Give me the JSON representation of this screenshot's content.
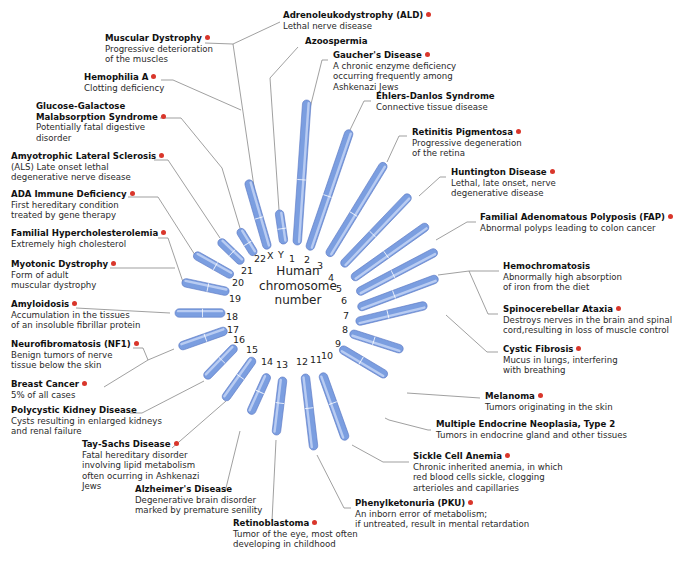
{
  "center_label": [
    "Human",
    "chromosome",
    "number"
  ],
  "colors": {
    "chromosome": "#7b9ee0",
    "chromosome_highlight": "#b9ccf2",
    "leader_line": "#777777",
    "marker_dot": "#d9362b"
  },
  "chromosomes": [
    {
      "id": "1",
      "x1": 307,
      "y1": 100,
      "x2": 297,
      "y2": 245,
      "lx": 293,
      "ly": 259
    },
    {
      "id": "2",
      "x1": 350,
      "y1": 130,
      "x2": 309,
      "y2": 250,
      "lx": 308,
      "ly": 260
    },
    {
      "id": "3",
      "x1": 385,
      "y1": 163,
      "x2": 328,
      "y2": 256,
      "lx": 321,
      "ly": 266
    },
    {
      "id": "4",
      "x1": 410,
      "y1": 195,
      "x2": 342,
      "y2": 266,
      "lx": 332,
      "ly": 278
    },
    {
      "id": "5",
      "x1": 428,
      "y1": 225,
      "x2": 352,
      "y2": 279,
      "lx": 340,
      "ly": 289
    },
    {
      "id": "6",
      "x1": 437,
      "y1": 251,
      "x2": 357,
      "y2": 293,
      "lx": 345,
      "ly": 301
    },
    {
      "id": "7",
      "x1": 438,
      "y1": 278,
      "x2": 358,
      "y2": 308,
      "lx": 347,
      "ly": 316
    },
    {
      "id": "8",
      "x1": 427,
      "y1": 305,
      "x2": 356,
      "y2": 322,
      "lx": 346,
      "ly": 330
    },
    {
      "id": "9",
      "x1": 403,
      "y1": 350,
      "x2": 350,
      "y2": 333,
      "lx": 339,
      "ly": 344
    },
    {
      "id": "10",
      "x1": 387,
      "y1": 376,
      "x2": 340,
      "y2": 348,
      "lx": 325,
      "ly": 356
    },
    {
      "id": "11",
      "x1": 346,
      "y1": 440,
      "x2": 322,
      "y2": 373,
      "lx": 314,
      "ly": 360
    },
    {
      "id": "12",
      "x1": 314,
      "y1": 450,
      "x2": 305,
      "y2": 374,
      "lx": 300,
      "ly": 362
    },
    {
      "id": "13",
      "x1": 276,
      "y1": 435,
      "x2": 283,
      "y2": 377,
      "lx": 280,
      "ly": 365
    },
    {
      "id": "14",
      "x1": 250,
      "y1": 414,
      "x2": 268,
      "y2": 374,
      "lx": 265,
      "ly": 362
    },
    {
      "id": "15",
      "x1": 224,
      "y1": 400,
      "x2": 254,
      "y2": 358,
      "lx": 250,
      "ly": 350
    },
    {
      "id": "16",
      "x1": 205,
      "y1": 378,
      "x2": 236,
      "y2": 346,
      "lx": 237,
      "ly": 340
    },
    {
      "id": "17",
      "x1": 179,
      "y1": 347,
      "x2": 227,
      "y2": 330,
      "lx": 231,
      "ly": 330
    },
    {
      "id": "18",
      "x1": 175,
      "y1": 313,
      "x2": 225,
      "y2": 313,
      "lx": 230,
      "ly": 317
    },
    {
      "id": "19",
      "x1": 182,
      "y1": 282,
      "x2": 229,
      "y2": 292,
      "lx": 233,
      "ly": 299
    },
    {
      "id": "20",
      "x1": 194,
      "y1": 254,
      "x2": 233,
      "y2": 276,
      "lx": 236,
      "ly": 283
    },
    {
      "id": "21",
      "x1": 219,
      "y1": 240,
      "x2": 243,
      "y2": 263,
      "lx": 245,
      "ly": 271
    },
    {
      "id": "22",
      "x1": 239,
      "y1": 229,
      "x2": 255,
      "y2": 255,
      "lx": 258,
      "ly": 259
    },
    {
      "id": "X",
      "x1": 248,
      "y1": 180,
      "x2": 268,
      "y2": 249,
      "lx": 271,
      "ly": 256
    },
    {
      "id": "Y",
      "x1": 279,
      "y1": 210,
      "x2": 284,
      "y2": 244,
      "lx": 282,
      "ly": 255
    }
  ],
  "diseases": [
    {
      "name": "Adrenoleukodystrophy (ALD)",
      "desc": [
        "Lethal nerve disease"
      ],
      "dot": true,
      "x": 283,
      "y": 15,
      "line": [
        [
          280,
          22
        ],
        [
          233,
          44
        ],
        [
          262,
          241
        ]
      ]
    },
    {
      "name": "Muscular Dystrophy",
      "desc": [
        "Progressive deterioration",
        "of the muscles"
      ],
      "dot": true,
      "x": 105,
      "y": 38,
      "line": [
        [
          205,
          43
        ],
        [
          233,
          44
        ]
      ]
    },
    {
      "name": "Azoospermia",
      "desc": [],
      "dot": false,
      "x": 305,
      "y": 41,
      "line": [
        [
          298,
          47
        ],
        [
          270,
          78
        ],
        [
          279,
          210
        ]
      ]
    },
    {
      "name": "Gaucher's Disease",
      "desc": [
        "A chronic enzyme deficiency",
        "occurring frequently among",
        "Ashkenazi Jews"
      ],
      "dot": true,
      "x": 333,
      "y": 55,
      "line": [
        [
          328,
          60
        ],
        [
          322,
          60
        ],
        [
          309,
          112
        ]
      ]
    },
    {
      "name": "Hemophilia A",
      "desc": [
        "Clotting deficiency"
      ],
      "dot": true,
      "x": 84,
      "y": 77,
      "line": [
        [
          161,
          80
        ],
        [
          173,
          80
        ],
        [
          241,
          110
        ]
      ]
    },
    {
      "name": "Ehlers-Danlos Syndrome",
      "desc": [
        "Connective tissue disease"
      ],
      "dot": false,
      "x": 376,
      "y": 96,
      "line": [
        [
          371,
          101
        ],
        [
          364,
          101
        ],
        [
          350,
          130
        ]
      ]
    },
    {
      "name": "Glucose-Galactose",
      "name2": "Malabsorption Syndrome",
      "desc": [
        "Potentially fatal digestive",
        "disorder"
      ],
      "dot": true,
      "x": 36,
      "y": 106,
      "line": [
        [
          160,
          118
        ],
        [
          181,
          118
        ],
        [
          222,
          168
        ],
        [
          240,
          228
        ]
      ]
    },
    {
      "name": "Retinitis Pigmentosa",
      "desc": [
        "Progressive degeneration",
        "of the retina"
      ],
      "dot": true,
      "x": 412,
      "y": 132,
      "line": [
        [
          407,
          136
        ],
        [
          399,
          136
        ],
        [
          387,
          162
        ]
      ]
    },
    {
      "name": "Amyotrophic Lateral Sclerosis",
      "desc": [
        "(ALS)  Late onset lethal",
        "degenerative nerve disease"
      ],
      "dot": true,
      "x": 11,
      "y": 156,
      "line": [
        [
          154,
          160
        ],
        [
          168,
          160
        ],
        [
          220,
          238
        ]
      ]
    },
    {
      "name": "Huntington Disease",
      "desc": [
        "Lethal, late onset, nerve",
        "degenerative disease"
      ],
      "dot": true,
      "x": 451,
      "y": 172,
      "line": [
        [
          446,
          177
        ],
        [
          440,
          177
        ],
        [
          419,
          196
        ]
      ]
    },
    {
      "name": "ADA Immune Deficiency",
      "desc": [
        "First hereditary condition",
        "treated by gene therapy"
      ],
      "dot": true,
      "x": 11,
      "y": 194,
      "line": [
        [
          128,
          197
        ],
        [
          158,
          197
        ],
        [
          195,
          255
        ]
      ]
    },
    {
      "name": "Familial Adenomatous Polyposis (FAP)",
      "desc": [
        "Abnormal polyps leading to colon cancer"
      ],
      "dot": true,
      "x": 480,
      "y": 217,
      "line": [
        [
          476,
          222
        ],
        [
          467,
          222
        ],
        [
          436,
          240
        ]
      ]
    },
    {
      "name": "Familial Hypercholesterolemia",
      "desc": [
        "Extremely high cholesterol"
      ],
      "dot": true,
      "x": 11,
      "y": 233,
      "line": [
        [
          158,
          238
        ],
        [
          168,
          238
        ],
        [
          183,
          282
        ]
      ]
    },
    {
      "name": "Myotonic Dystrophy",
      "desc": [
        "Form of adult",
        "muscular dystrophy"
      ],
      "dot": true,
      "x": 11,
      "y": 264,
      "line": [
        [
          110,
          268
        ],
        [
          175,
          268
        ]
      ]
    },
    {
      "name": "Hemochromatosis",
      "desc": [
        "Abnormally high absorption",
        "of iron from the diet"
      ],
      "dot": false,
      "x": 503,
      "y": 266,
      "line": [
        [
          499,
          271
        ],
        [
          469,
          271
        ],
        [
          438,
          275
        ]
      ],
      "branch": [
        [
          469,
          271
        ],
        [
          488,
          314
        ],
        [
          498,
          314
        ]
      ]
    },
    {
      "name": "Amyloidosis",
      "desc": [
        "Accumulation in the tissues",
        "of an insoluble fibrillar protein"
      ],
      "dot": true,
      "x": 11,
      "y": 304,
      "line": [
        [
          76,
          308
        ],
        [
          170,
          313
        ]
      ]
    },
    {
      "name": "Spinocerebellar Ataxia",
      "desc": [
        "Destroys nerves in the brain and spinal",
        "cord,resulting in loss of muscle control"
      ],
      "dot": true,
      "x": 503,
      "y": 309,
      "line": []
    },
    {
      "name": "Neurofibromatosis (NF1)",
      "desc": [
        "Benign tumors of nerve",
        "tissue below the skin"
      ],
      "dot": true,
      "x": 11,
      "y": 344,
      "line": [
        [
          133,
          348
        ],
        [
          143,
          348
        ],
        [
          148,
          360
        ],
        [
          104,
          387
        ]
      ],
      "branch": [
        [
          148,
          360
        ],
        [
          174,
          349
        ]
      ]
    },
    {
      "name": "Cystic Fibrosis",
      "desc": [
        "Mucus in lungs, interfering",
        "with breathing"
      ],
      "dot": true,
      "x": 503,
      "y": 349,
      "line": [
        [
          498,
          352
        ],
        [
          487,
          352
        ],
        [
          446,
          315
        ]
      ]
    },
    {
      "name": "Breast Cancer",
      "desc": [
        "5% of all cases"
      ],
      "dot": true,
      "x": 11,
      "y": 384,
      "line": []
    },
    {
      "name": "Melanoma",
      "desc": [
        "Tumors originating in the skin"
      ],
      "dot": true,
      "x": 485,
      "y": 396,
      "line": [
        [
          480,
          398
        ],
        [
          407,
          393
        ]
      ]
    },
    {
      "name": "Polycystic Kidney Disease",
      "desc": [
        "Cysts resulting in enlarged kidneys",
        "and renal failure"
      ],
      "dot": false,
      "x": 11,
      "y": 410,
      "line": [
        [
          130,
          413
        ],
        [
          142,
          413
        ],
        [
          204,
          381
        ]
      ]
    },
    {
      "name": "Multiple Endocrine Neoplasia, Type 2",
      "desc": [
        "Tumors in endocrine gland and other tissues"
      ],
      "dot": false,
      "x": 436,
      "y": 424,
      "line": [
        [
          431,
          430
        ],
        [
          428,
          430
        ],
        [
          389,
          420
        ],
        [
          385,
          418
        ]
      ]
    },
    {
      "name": "Tay-Sachs Disease",
      "desc": [
        "Fatal hereditary disorder",
        "involving lipid metabolism",
        "often ocurring in Ashkenazi",
        "Jews"
      ],
      "dot": true,
      "x": 82,
      "y": 444,
      "line": [
        [
          172,
          448
        ],
        [
          226,
          401
        ]
      ]
    },
    {
      "name": "Sickle Cell Anemia",
      "desc": [
        "Chronic inherited anemia, in which",
        "red blood cells sickle, clogging",
        "arterioles and capillaries"
      ],
      "dot": true,
      "x": 413,
      "y": 456,
      "line": [
        [
          409,
          462
        ],
        [
          383,
          462
        ],
        [
          352,
          445
        ]
      ]
    },
    {
      "name": "Alzheimer's Disease",
      "desc": [
        "Degenerative brain disorder",
        "marked by premature senility"
      ],
      "dot": false,
      "x": 135,
      "y": 489,
      "line": [
        [
          225,
          492
        ],
        [
          240,
          431
        ]
      ]
    },
    {
      "name": "Phenylketonuria (PKU)",
      "desc": [
        "An inborn error of metabolism;",
        "if untreated, result in mental retardation"
      ],
      "dot": true,
      "x": 355,
      "y": 503,
      "line": [
        [
          351,
          508
        ],
        [
          344,
          508
        ],
        [
          317,
          455
        ]
      ]
    },
    {
      "name": "Retinoblastoma",
      "desc": [
        "Tumor of the eye, most often",
        "developing in childhood"
      ],
      "dot": true,
      "x": 233,
      "y": 523,
      "line": [
        [
          272,
          521
        ],
        [
          276,
          440
        ]
      ]
    }
  ]
}
